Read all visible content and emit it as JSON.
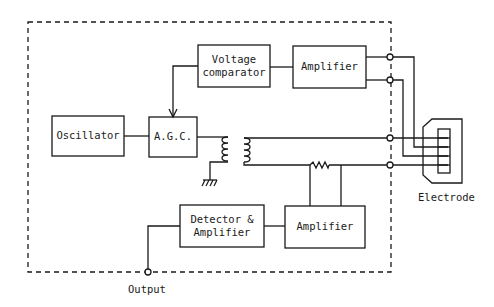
{
  "diagram": {
    "type": "block-diagram",
    "colors": {
      "line": "#1a1a1a",
      "background": "#ffffff"
    },
    "blocks": {
      "voltage_comparator": {
        "line1": "Voltage",
        "line2": "comparator"
      },
      "amplifier_top": {
        "label": "Amplifier"
      },
      "oscillator": {
        "label": "Oscillator"
      },
      "agc": {
        "label": "A.G.C."
      },
      "detector_amplifier": {
        "line1": "Detector &",
        "line2": "Amplifier"
      },
      "amplifier_bottom": {
        "label": "Amplifier"
      }
    },
    "labels": {
      "electrode": "Electrode",
      "output": "Output"
    },
    "components": [
      "transformer",
      "ground",
      "resistor",
      "terminals",
      "electrode-connector"
    ]
  }
}
